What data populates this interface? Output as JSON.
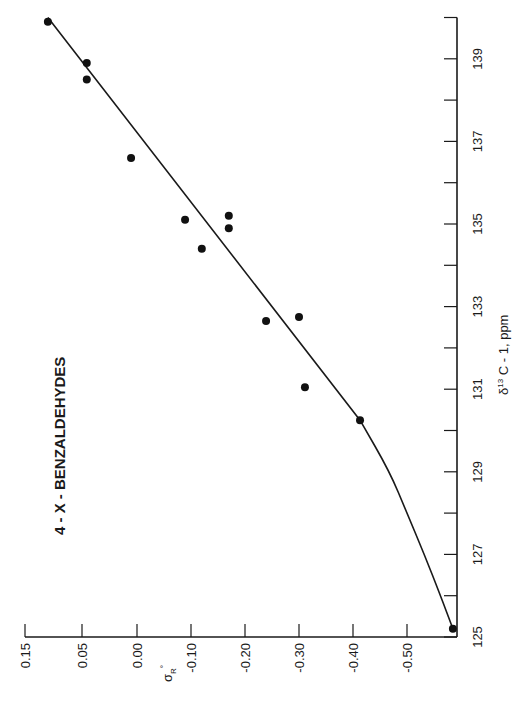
{
  "chart_data": {
    "type": "scatter",
    "orientation": "rotated-90-ccw",
    "title": "4 - X - BENZALDEHYDES",
    "xlabel": "δ13 C - 1, ppm",
    "xlabel_parts": {
      "delta": "δ",
      "sup": "13",
      "rest": " C - 1, ppm"
    },
    "ylabel": "σR°",
    "ylabel_parts": {
      "sigma": "σ",
      "sub": "R",
      "sup": "°"
    },
    "xlim": [
      125,
      140
    ],
    "ylim": [
      -0.6,
      0.2
    ],
    "x_ticks_labeled": [
      125,
      127,
      129,
      131,
      133,
      135,
      137,
      139
    ],
    "x_ticks_minor": [
      126,
      128,
      130,
      132,
      134,
      136,
      138,
      140
    ],
    "y_ticks": [
      {
        "value": 0.2,
        "label": "0.15"
      },
      {
        "value": 0.1,
        "label": "0.05"
      },
      {
        "value": 0.0,
        "label": "0.00"
      },
      {
        "value": -0.1,
        "label": "-0.10"
      },
      {
        "value": -0.2,
        "label": "-0.20"
      },
      {
        "value": -0.3,
        "label": "-0.30"
      },
      {
        "value": -0.4,
        "label": "-0.40"
      },
      {
        "value": -0.5,
        "label": "-0.50"
      }
    ],
    "grid": false,
    "legend": null,
    "points": [
      {
        "x": 139.9,
        "y": 0.165
      },
      {
        "x": 138.9,
        "y": 0.093
      },
      {
        "x": 138.5,
        "y": 0.093
      },
      {
        "x": 136.6,
        "y": 0.011
      },
      {
        "x": 135.1,
        "y": -0.089
      },
      {
        "x": 135.2,
        "y": -0.17
      },
      {
        "x": 134.9,
        "y": -0.17
      },
      {
        "x": 134.4,
        "y": -0.12
      },
      {
        "x": 132.65,
        "y": -0.239
      },
      {
        "x": 132.75,
        "y": -0.3
      },
      {
        "x": 131.05,
        "y": -0.311
      },
      {
        "x": 130.25,
        "y": -0.413
      },
      {
        "x": 125.2,
        "y": -0.585
      }
    ],
    "fit_curve": [
      {
        "x": 140.0,
        "y": 0.165
      },
      {
        "x": 135.0,
        "y": -0.14
      },
      {
        "x": 130.25,
        "y": -0.413
      },
      {
        "x": 129.0,
        "y": -0.468
      },
      {
        "x": 128.0,
        "y": -0.5
      },
      {
        "x": 127.0,
        "y": -0.532
      },
      {
        "x": 126.0,
        "y": -0.562
      },
      {
        "x": 125.2,
        "y": -0.585
      }
    ]
  }
}
